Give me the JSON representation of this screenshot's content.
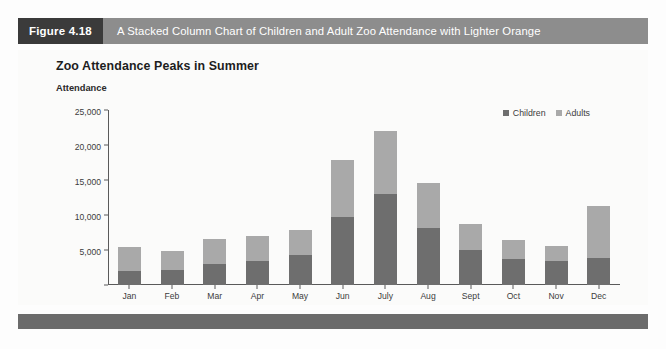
{
  "figure": {
    "tag": "Figure 4.18",
    "caption": "A Stacked Column Chart of Children and Adult Zoo Attendance with Lighter Orange"
  },
  "colors": {
    "tag_background": "#3b3b3b",
    "caption_background": "#8d8d8d",
    "children_series": "#6e6e6e",
    "adults_series": "#a9a9a9",
    "footer_band": "#6b6b6b",
    "panel_background": "#fbfbfa",
    "axis_line": "#5a5a5a"
  },
  "chart_data": {
    "type": "bar",
    "title": "Zoo Attendance Peaks in Summer",
    "subtitle": "",
    "xlabel": "",
    "ylabel": "Attendance",
    "stacked": true,
    "grid": false,
    "legend_position": "top-right",
    "ylim": [
      0,
      25000
    ],
    "yticks": [
      0,
      5000,
      10000,
      15000,
      20000,
      25000
    ],
    "ytick_labels": [
      "",
      "5,000",
      "10,000",
      "15,000",
      "20,000",
      "25,000"
    ],
    "categories": [
      "Jan",
      "Feb",
      "Mar",
      "Apr",
      "May",
      "Jun",
      "July",
      "Aug",
      "Sept",
      "Oct",
      "Nov",
      "Dec"
    ],
    "series": [
      {
        "name": "Children",
        "color": "#6e6e6e",
        "values": [
          2000,
          2100,
          3000,
          3400,
          4300,
          9700,
          13000,
          8200,
          5000,
          3700,
          3400,
          3900
        ]
      },
      {
        "name": "Adults",
        "color": "#a9a9a9",
        "values": [
          3400,
          2800,
          3600,
          3600,
          3600,
          8100,
          9000,
          6400,
          3700,
          2700,
          2200,
          7400
        ]
      }
    ],
    "totals": [
      5400,
      4900,
      6600,
      7000,
      7900,
      17800,
      22000,
      14600,
      8700,
      6400,
      5600,
      11300
    ]
  }
}
